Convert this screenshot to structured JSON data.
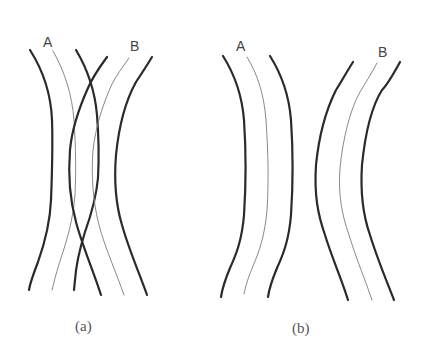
{
  "figure": {
    "colors": {
      "background": "#ffffff",
      "thick_line": "#2a2a2a",
      "thin_line": "#7a7a7a",
      "text": "#444444"
    },
    "panels": [
      {
        "id": "a",
        "caption": "(a)",
        "note": "Bands A and B cross/overlap each other",
        "bands": [
          {
            "label": "A"
          },
          {
            "label": "B"
          }
        ]
      },
      {
        "id": "b",
        "caption": "(b)",
        "note": "Bands A and B are separated and do not overlap",
        "bands": [
          {
            "label": "A"
          },
          {
            "label": "B"
          }
        ]
      }
    ]
  }
}
